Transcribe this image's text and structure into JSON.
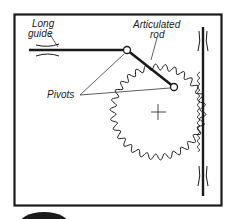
{
  "diagram": {
    "labels": {
      "long_guide_line1": "Long",
      "long_guide_line2": "guide",
      "articulated_rod_line1": "Articulated",
      "articulated_rod_line2": "rod",
      "pivots": "Pivots"
    },
    "components": [
      {
        "name": "frame",
        "type": "rectangle"
      },
      {
        "name": "long-guide",
        "type": "horizontal rod with bushing"
      },
      {
        "name": "articulated-rod",
        "type": "link between two pivots"
      },
      {
        "name": "pivot-left",
        "type": "pivot"
      },
      {
        "name": "pivot-right",
        "type": "pivot on gear"
      },
      {
        "name": "gear",
        "type": "spur gear"
      },
      {
        "name": "rack",
        "type": "vertical rack with guides"
      }
    ],
    "colors": {
      "ink": "#1a1a1a",
      "background": "#ffffff"
    }
  }
}
